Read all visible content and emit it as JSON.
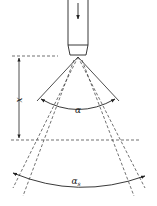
{
  "diagram": {
    "type": "spray-nozzle-angle",
    "labels": {
      "distance": "x",
      "spray_angle": "α",
      "spray_angle_at_distance": "α",
      "spray_angle_at_distance_subscript": "s"
    },
    "colors": {
      "line": "#222222",
      "background": "#ffffff"
    }
  }
}
